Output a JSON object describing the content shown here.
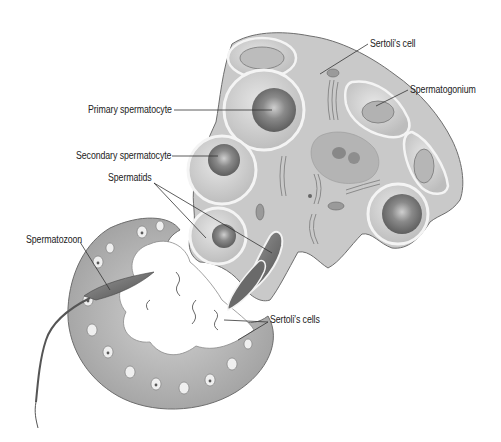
{
  "diagram": {
    "labels": [
      {
        "id": "sertoli-cell",
        "text": "Sertoli's cell",
        "x": 370,
        "y": 38,
        "align": "left",
        "line": [
          [
            368,
            44
          ],
          [
            320,
            74
          ]
        ]
      },
      {
        "id": "spermatogonium",
        "text": "Spermatogonium",
        "x": 410,
        "y": 84,
        "align": "left",
        "line": [
          [
            408,
            90
          ],
          [
            376,
            106
          ]
        ]
      },
      {
        "id": "primary-spermatocyte",
        "text": "Primary spermatocyte",
        "x": 88,
        "y": 104,
        "align": "left",
        "line": [
          [
            174,
            110
          ],
          [
            272,
            110
          ]
        ]
      },
      {
        "id": "secondary-spermatocyte",
        "text": "Secondary spermatocyte",
        "x": 76,
        "y": 150,
        "align": "left",
        "line": [
          [
            172,
            156
          ],
          [
            218,
            156
          ]
        ]
      },
      {
        "id": "spermatids",
        "text": "Spermatids",
        "x": 108,
        "y": 173,
        "align": "left",
        "line": [
          [
            154,
            183
          ],
          [
            206,
            238
          ]
        ],
        "line2": [
          [
            154,
            183
          ],
          [
            272,
            253
          ]
        ]
      },
      {
        "id": "spermatozoon",
        "text": "Spermatozoon",
        "x": 26,
        "y": 234,
        "align": "left",
        "line": [
          [
            80,
            242
          ],
          [
            110,
            290
          ]
        ]
      },
      {
        "id": "sertolis-cells",
        "text": "Sertoli's cells",
        "x": 270,
        "y": 314,
        "align": "left",
        "line": [
          [
            268,
            322
          ],
          [
            238,
            340
          ]
        ],
        "line2": [
          [
            268,
            322
          ],
          [
            224,
            320
          ]
        ]
      }
    ]
  },
  "colors": {
    "background": "#ffffff",
    "cytoplasm": "#c9c9c9",
    "cytoplasm_dark": "#a8a8a8",
    "cell_light": "#dcdcdc",
    "nucleus": "#8a8a8a",
    "nucleus_dark": "#5e5e5e",
    "outline": "#6e6e6e",
    "membrane_highlight": "#f4f4f4",
    "spermatozoon": "#6f6f6f",
    "label_text": "#222222",
    "leader_line": "#333333"
  }
}
